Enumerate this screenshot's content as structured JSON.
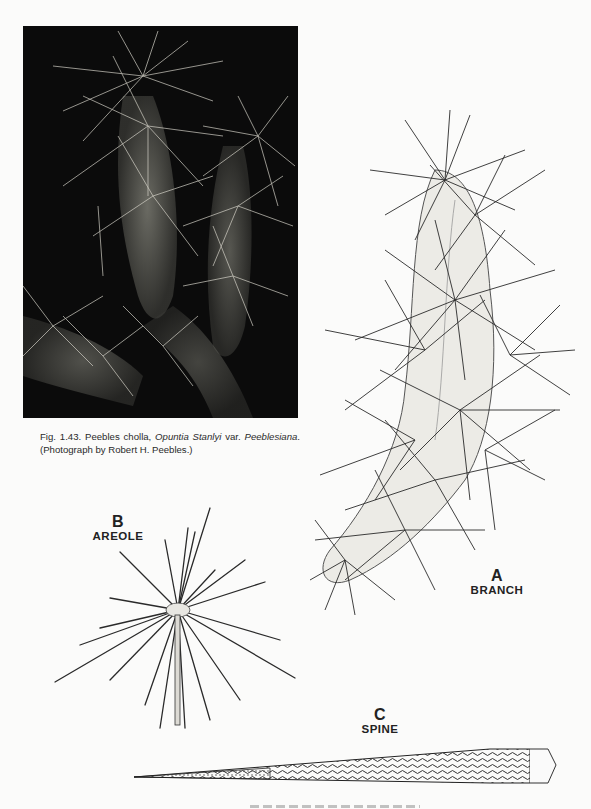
{
  "figure": {
    "photo": {
      "subject": "Peebles cholla photograph",
      "background_color": "#0b0b0b"
    },
    "caption": {
      "prefix": "Fig. 1.43. Peebles cholla, ",
      "genus_species": "Opuntia Stanlyi",
      "var_label": " var. ",
      "variety": "Peeblesiana",
      "suffix": ". (Photograph by Robert H. Peebles.)"
    },
    "drawings": [
      {
        "letter": "A",
        "label": "BRANCH"
      },
      {
        "letter": "B",
        "label": "AREOLE"
      },
      {
        "letter": "C",
        "label": "SPINE"
      }
    ],
    "bottom_caption_partial": ""
  }
}
